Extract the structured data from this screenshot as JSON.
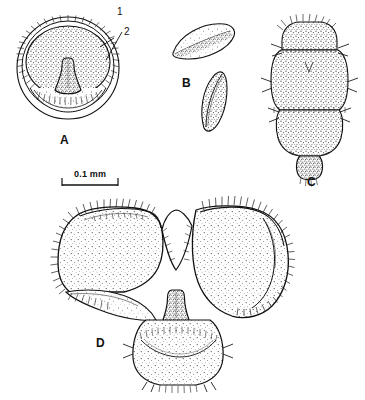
{
  "figure": {
    "type": "scientific-illustration-plate",
    "background_color": "#ffffff",
    "ink_color": "#111111",
    "stipple_color": "#3a3a3a",
    "width": 365,
    "height": 400,
    "panels": [
      {
        "letter": "A",
        "description": "Circular sucker-like disc in ventral view with concentric outer rim, dense marginal setal fringe, stippled inner disc and a central tongue-shaped median projection",
        "callouts": [
          "1",
          "2"
        ]
      },
      {
        "letter": "B",
        "description": "Two detached crescent / lens-shaped sclerites shown separately, upper one near horizontal, lower one oblique",
        "callouts": []
      },
      {
        "letter": "C",
        "description": "Elongate segmented body, stippled throughout, with paired lateral setae at segment boundaries and a rounded terminal lobe",
        "callouts": []
      },
      {
        "letter": "D",
        "description": "Large bilobed butterfly-shaped plate with deep median notch, marginal setal fringes, and a rounded ventral lobe below bearing a median projection",
        "callouts": []
      }
    ],
    "callout_labels": [
      {
        "id": "1",
        "text": "1",
        "points_to": "outer marginal rim of disc A"
      },
      {
        "id": "2",
        "text": "2",
        "points_to": "inner stippled disc margin of A"
      }
    ],
    "scale_bar": {
      "label": "0.1 mm",
      "length_px": 56,
      "x_start": 62,
      "x_end": 118,
      "y": 182
    }
  }
}
